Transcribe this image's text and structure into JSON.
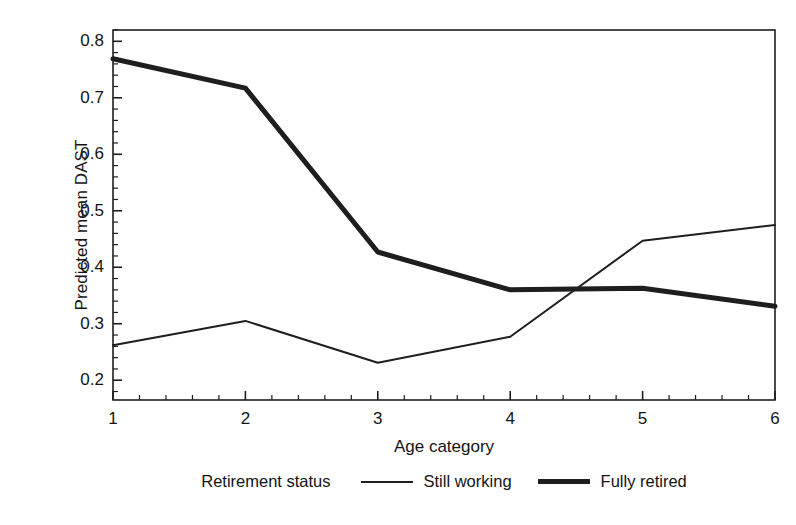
{
  "chart_data": {
    "type": "line",
    "title": "",
    "xlabel": "Age category",
    "ylabel": "Predicted mean DAST",
    "categories": [
      "1",
      "2",
      "3",
      "4",
      "5",
      "6"
    ],
    "x": [
      1,
      2,
      3,
      4,
      5,
      6
    ],
    "xlim": [
      1,
      6
    ],
    "ylim": [
      0.165,
      0.82
    ],
    "yticks": [
      0.2,
      0.3,
      0.4,
      0.5,
      0.6,
      0.7,
      0.8
    ],
    "ytick_labels": [
      "0.2",
      "0.3",
      "0.4",
      "0.5",
      "0.6",
      "0.7",
      "0.8"
    ],
    "minor_ticks": true,
    "grid": false,
    "legend_position": "below-axes",
    "legend_title": "Retirement status",
    "series": [
      {
        "name": "Still working",
        "style": "thin",
        "color": "#1e1e1e",
        "linewidth": 2,
        "values": [
          0.262,
          0.305,
          0.231,
          0.277,
          0.447,
          0.475
        ]
      },
      {
        "name": "Fully retired",
        "style": "thick",
        "color": "#1e1e1e",
        "linewidth": 5,
        "values": [
          0.769,
          0.717,
          0.427,
          0.36,
          0.363,
          0.331
        ]
      }
    ]
  },
  "axes": {
    "ylabel": "Predicted mean DAST",
    "xlabel": "Age category"
  },
  "legend": {
    "title": "Retirement status",
    "entries": [
      {
        "label": "Still working",
        "style": "thin"
      },
      {
        "label": "Fully retired",
        "style": "thick"
      }
    ]
  }
}
